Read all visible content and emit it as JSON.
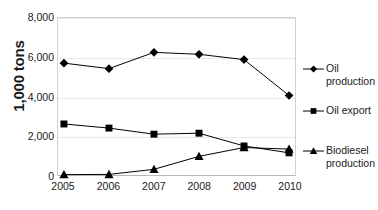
{
  "chart_data": {
    "type": "line",
    "title": "",
    "xlabel": "",
    "ylabel": "1,000 tons",
    "categories": [
      "2005",
      "2006",
      "2007",
      "2008",
      "2009",
      "2010"
    ],
    "x": [
      2005,
      2006,
      2007,
      2008,
      2009,
      2010
    ],
    "ylim": [
      0,
      8000
    ],
    "y_ticks": [
      0,
      2000,
      4000,
      6000,
      8000
    ],
    "y_tick_labels": [
      "0",
      "2,000",
      "4,000",
      "6,000",
      "8,000"
    ],
    "grid": true,
    "legend_position": "right",
    "series": [
      {
        "name": "Oil production",
        "marker": "diamond",
        "color": "#000000",
        "values": [
          5700,
          5420,
          6250,
          6150,
          5880,
          4050
        ]
      },
      {
        "name": "Oil export",
        "marker": "square",
        "color": "#000000",
        "values": [
          2600,
          2390,
          2080,
          2130,
          1480,
          1130
        ]
      },
      {
        "name": "Biodiesel production",
        "marker": "triangle",
        "color": "#000000",
        "values": [
          20,
          30,
          290,
          950,
          1400,
          1320
        ]
      }
    ]
  },
  "legend": {
    "entries": [
      {
        "label_line1": "Oil",
        "label_line2": "production",
        "marker": "diamond-marker-icon"
      },
      {
        "label_line1": "Oil export",
        "label_line2": "",
        "marker": "square-marker-icon"
      },
      {
        "label_line1": "Biodiesel",
        "label_line2": "production",
        "marker": "triangle-marker-icon"
      }
    ]
  },
  "axis": {
    "y_title": "1,000 tons"
  },
  "colors": {
    "series": "#000000",
    "gridline": "#e9e9e9",
    "plot_border": "#d2d2d2",
    "background": "#ffffff",
    "text": "#1a1a1a"
  }
}
